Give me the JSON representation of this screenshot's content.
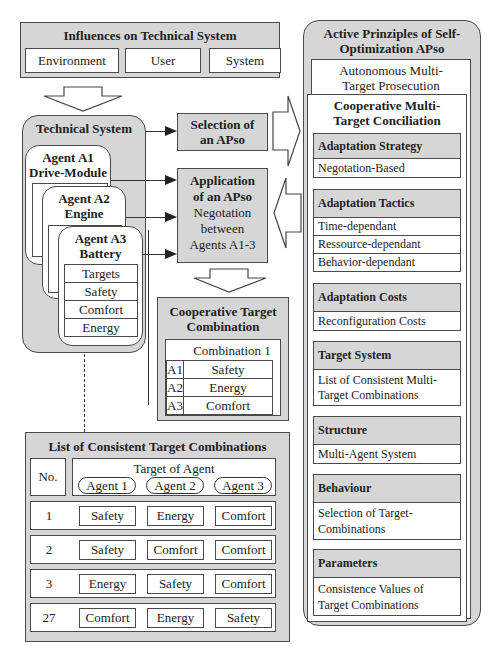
{
  "influences": {
    "title": "Influences on Technical System",
    "items": [
      "Environment",
      "User",
      "System"
    ]
  },
  "technical_system": {
    "title": "Technical System",
    "agents": [
      {
        "name": "Agent A1",
        "role": "Drive-Module"
      },
      {
        "name": "Agent A2",
        "role": "Engine"
      },
      {
        "name": "Agent A3",
        "role": "Battery",
        "rows": [
          "Targets",
          "Safety",
          "Comfort",
          "Energy"
        ]
      }
    ]
  },
  "selection": {
    "line1": "Selection of",
    "line2": "an APso"
  },
  "application": {
    "line1": "Application",
    "line2": "of an APso",
    "line3": "Negotation",
    "line4": "between",
    "line5": "Agents A1-3"
  },
  "cooperative_combination": {
    "title_line1": "Cooperative Target",
    "title_line2": "Combination",
    "header": "Combination 1",
    "rows": [
      {
        "agent": "A1",
        "target": "Safety"
      },
      {
        "agent": "A2",
        "target": "Energy"
      },
      {
        "agent": "A3",
        "target": "Comfort"
      }
    ]
  },
  "list": {
    "title": "List of Consistent Target Combinations",
    "no_label": "No.",
    "target_label": "Target of Agent",
    "agents": [
      "Agent 1",
      "Agent 2",
      "Agent 3"
    ],
    "rows": [
      {
        "no": "1",
        "targets": [
          "Safety",
          "Energy",
          "Comfort"
        ]
      },
      {
        "no": "2",
        "targets": [
          "Safety",
          "Comfort",
          "Comfort"
        ]
      },
      {
        "no": "3",
        "targets": [
          "Energy",
          "Safety",
          "Comfort"
        ]
      },
      {
        "no": "27",
        "targets": [
          "Comfort",
          "Energy",
          "Safety"
        ]
      }
    ]
  },
  "apso": {
    "title_line1": "Active Prinziples of Self-",
    "title_line2": "Optimization APso",
    "autonomous_line1": "Autonomous Multi-",
    "autonomous_line2": "Target Prosecution",
    "cooperative_line1": "Cooperative Multi-",
    "cooperative_line2": "Target Conciliation",
    "sections": [
      {
        "title": "Adaptation Strategy",
        "items": [
          "Negotation-Based"
        ]
      },
      {
        "title": "Adaptation Tactics",
        "items": [
          "Time-dependant",
          "Ressource-dependant",
          "Behavior-dependant"
        ]
      },
      {
        "title": "Adaptation Costs",
        "items": [
          "Reconfiguration Costs"
        ]
      },
      {
        "title": "Target System",
        "items": [
          "List of Consistent Multi-",
          "Target Combinations"
        ]
      },
      {
        "title": "Structure",
        "items": [
          "Multi-Agent System"
        ]
      },
      {
        "title": "Behaviour",
        "items": [
          "Selection of Target-",
          "Combinations"
        ]
      },
      {
        "title": "Parameters",
        "items": [
          "Consistence Values of",
          "Target Combinations"
        ]
      }
    ]
  },
  "colors": {
    "panel_fill": "#d6d6d6",
    "border": "#4a4a4a",
    "background": "#ffffff"
  }
}
